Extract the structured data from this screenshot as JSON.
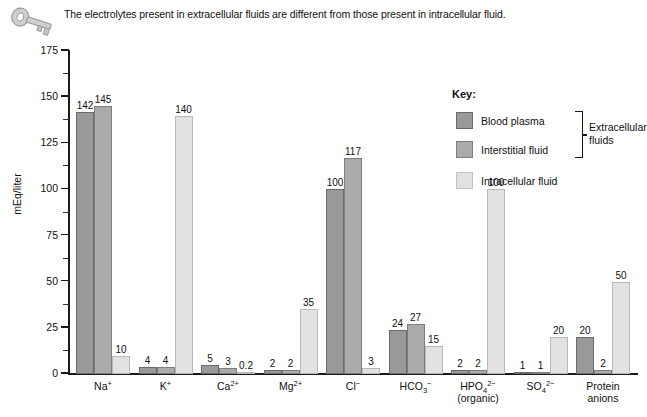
{
  "caption": {
    "text": "The electrolytes present in extracellular fluids are different from those present in intracellular fluid.",
    "icon": "key-icon"
  },
  "legend": {
    "title": "Key:",
    "entries": [
      {
        "label": "Blood plasma",
        "color": "#999999"
      },
      {
        "label": "Interstitial fluid",
        "color": "#ababab"
      },
      {
        "label": "Intracellular fluid",
        "color": "#e2e2e2"
      }
    ],
    "group_label": "Extracellular fluids"
  },
  "chart_data": {
    "type": "bar",
    "title": "",
    "xlabel": "",
    "ylabel": "mEq/liter",
    "ylim": [
      0,
      175
    ],
    "yticks": [
      0,
      25,
      50,
      75,
      100,
      125,
      150,
      175
    ],
    "ytick_labels": [
      "0",
      "25",
      "50",
      "75",
      "100",
      "125",
      "150",
      "175"
    ],
    "minor_tick_interval": 12.5,
    "grid": false,
    "legend_position": "top-right",
    "categories": [
      "Na+",
      "K+",
      "Ca2+",
      "Mg2+",
      "Cl-",
      "HCO3-",
      "HPO4 2- (organic)",
      "SO4 2-",
      "Protein anions"
    ],
    "category_labels_html": [
      "Na<sup>+</sup>",
      "K<sup>+</sup>",
      "Ca<sup>2+</sup>",
      "Mg<sup>2+</sup>",
      "Cl<sup>&#8722;</sup>",
      "HCO<sub>3</sub><sup>&#8722;</sup>",
      "HPO<sub>4</sub><sup>2&#8722;</sup><br>(organic)",
      "SO<sub>4</sub><sup>2&#8722;</sup>",
      "Protein<br>anions"
    ],
    "series": [
      {
        "name": "Blood plasma",
        "color": "#999999",
        "values": [
          142,
          4,
          5,
          2,
          100,
          24,
          2,
          1,
          20
        ],
        "labels": [
          "142",
          "4",
          "5",
          "2",
          "100",
          "24",
          "2",
          "1",
          "20"
        ]
      },
      {
        "name": "Interstitial fluid",
        "color": "#ababab",
        "values": [
          145,
          4,
          3,
          2,
          117,
          27,
          2,
          1,
          2
        ],
        "labels": [
          "145",
          "4",
          "3",
          "2",
          "117",
          "27",
          "2",
          "1",
          "2"
        ]
      },
      {
        "name": "Intracellular fluid",
        "color": "#e2e2e2",
        "values": [
          10,
          140,
          0.2,
          35,
          3,
          15,
          100,
          20,
          50
        ],
        "labels": [
          "10",
          "140",
          "0.2",
          "35",
          "3",
          "15",
          "100",
          "20",
          "50"
        ]
      }
    ]
  }
}
